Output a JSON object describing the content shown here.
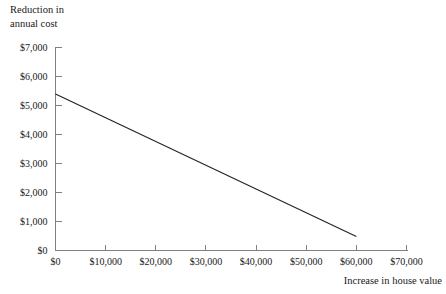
{
  "chart_data": {
    "type": "line",
    "title": "",
    "ylabel": "Reduction in\nannual cost",
    "xlabel": "Increase in house value",
    "xlim": [
      0,
      70000
    ],
    "ylim": [
      0,
      7000
    ],
    "grid": false,
    "legend": "none",
    "xticks": [
      0,
      10000,
      20000,
      30000,
      40000,
      50000,
      60000,
      70000
    ],
    "yticks": [
      0,
      1000,
      2000,
      3000,
      4000,
      5000,
      6000,
      7000
    ],
    "xticklabels": [
      "$0",
      "$10,000",
      "$20,000",
      "$30,000",
      "$40,000",
      "$50,000",
      "$60,000",
      "$70,000"
    ],
    "yticklabels": [
      "$0",
      "$1,000",
      "$2,000",
      "$3,000",
      "$4,000",
      "$5,000",
      "$6,000",
      "$7,000"
    ],
    "series": [
      {
        "name": "Reduction in annual cost",
        "color": "#222222",
        "x": [
          0,
          60000
        ],
        "values": [
          5400,
          480
        ]
      }
    ]
  },
  "axes": {
    "y_title_line1": "Reduction in",
    "y_title_line2": "annual cost",
    "x_title": "Increase in house value"
  },
  "colors": {
    "axis": "#808080",
    "line": "#222222",
    "text": "#1a1a1a",
    "background": "#ffffff"
  }
}
